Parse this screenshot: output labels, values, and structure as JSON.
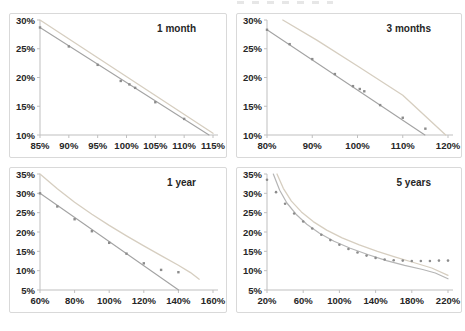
{
  "style": {
    "background": "#ffffff",
    "panel_border": "#d9d9d9",
    "axis_color": "#bfbfbf",
    "text_color": "#262626",
    "model_line_color": "#d6cec0",
    "market_line_color": "#a3a3a3",
    "marker_color": "#8c8c8c"
  },
  "chart_data": [
    {
      "type": "line",
      "title": "1 month",
      "xlim": [
        85,
        115
      ],
      "xticks": [
        85,
        90,
        95,
        100,
        105,
        110,
        115
      ],
      "ylim": [
        10,
        30
      ],
      "yticks": [
        10,
        15,
        20,
        25,
        30
      ],
      "tick_suffix": "%",
      "grid": false,
      "series": [
        {
          "name": "model-smile-line",
          "color": "#d6cec0",
          "width": 1.3,
          "line": true,
          "points": [
            [
              85,
              30
            ],
            [
              115,
              10.3
            ]
          ]
        },
        {
          "name": "market-iv-points",
          "color": "#a3a3a3",
          "width": 1.1,
          "line": true,
          "marker": "square",
          "marker_color": "#8c8c8c",
          "points": [
            [
              85,
              28.7
            ],
            [
              114.3,
              10
            ]
          ],
          "marker_points": [
            [
              85,
              28.7
            ],
            [
              90,
              25.4
            ],
            [
              95,
              22.2
            ],
            [
              99,
              19.4
            ],
            [
              100.5,
              18.8
            ],
            [
              101.5,
              18.2
            ],
            [
              105,
              15.7
            ],
            [
              110,
              12.8
            ]
          ]
        }
      ]
    },
    {
      "type": "line",
      "title": "3 months",
      "xlim": [
        80,
        120
      ],
      "xticks": [
        80,
        90,
        100,
        110,
        120
      ],
      "ylim": [
        10,
        30
      ],
      "yticks": [
        10,
        15,
        20,
        25,
        30
      ],
      "tick_suffix": "%",
      "grid": false,
      "series": [
        {
          "name": "model-smile-line",
          "color": "#d6cec0",
          "width": 1.3,
          "line": true,
          "points": [
            [
              83.5,
              30
            ],
            [
              91,
              26.5
            ],
            [
              100,
              22.0
            ],
            [
              110,
              16.9
            ],
            [
              119.5,
              10
            ]
          ]
        },
        {
          "name": "market-iv-points",
          "color": "#a3a3a3",
          "width": 1.1,
          "line": true,
          "marker": "square",
          "marker_color": "#8c8c8c",
          "points": [
            [
              80,
              28.3
            ],
            [
              114.9,
              10
            ]
          ],
          "marker_points": [
            [
              80,
              28.3
            ],
            [
              85,
              25.8
            ],
            [
              90,
              23.2
            ],
            [
              95,
              20.6
            ],
            [
              99,
              18.5
            ],
            [
              100.5,
              18.0
            ],
            [
              101.5,
              17.6
            ],
            [
              105,
              15.2
            ],
            [
              110,
              13.0
            ],
            [
              115,
              11.1
            ]
          ]
        }
      ]
    },
    {
      "type": "line",
      "title": "1 year",
      "xlim": [
        60,
        160
      ],
      "xticks": [
        60,
        80,
        100,
        120,
        140,
        160
      ],
      "ylim": [
        5,
        35
      ],
      "yticks": [
        5,
        10,
        15,
        20,
        25,
        30,
        35
      ],
      "tick_suffix": "%",
      "grid": false,
      "series": [
        {
          "name": "model-smile-line",
          "color": "#d6cec0",
          "width": 1.3,
          "line": true,
          "points": [
            [
              60,
              35
            ],
            [
              70,
              31.2
            ],
            [
              80,
              27.7
            ],
            [
              90,
              24.6
            ],
            [
              100,
              21.7
            ],
            [
              110,
              19.0
            ],
            [
              120,
              16.4
            ],
            [
              130,
              13.9
            ],
            [
              140,
              11.4
            ],
            [
              147,
              9.5
            ],
            [
              152,
              7.8
            ]
          ]
        },
        {
          "name": "market-iv-points",
          "color": "#a3a3a3",
          "width": 1.1,
          "line": true,
          "marker": "square",
          "marker_color": "#8c8c8c",
          "points": [
            [
              60,
              30
            ],
            [
              140.1,
              5
            ]
          ],
          "marker_points": [
            [
              60,
              30
            ],
            [
              70,
              26.6
            ],
            [
              80,
              23.3
            ],
            [
              90,
              20.2
            ],
            [
              100,
              17.2
            ],
            [
              110,
              14.4
            ],
            [
              120,
              11.9
            ],
            [
              130,
              10.2
            ],
            [
              140,
              9.6
            ]
          ]
        }
      ]
    },
    {
      "type": "line",
      "title": "5 years",
      "xlim": [
        20,
        220
      ],
      "xticks": [
        20,
        60,
        100,
        140,
        180,
        220
      ],
      "ylim": [
        5,
        35
      ],
      "yticks": [
        5,
        10,
        15,
        20,
        25,
        30,
        35
      ],
      "tick_suffix": "%",
      "grid": false,
      "series": [
        {
          "name": "model-curve-gray",
          "color": "#b5b5b5",
          "width": 1.2,
          "line": true,
          "points": [
            [
              27,
              35
            ],
            [
              34,
              30.8
            ],
            [
              42,
              27.5
            ],
            [
              52,
              24.6
            ],
            [
              64,
              22.0
            ],
            [
              78,
              19.7
            ],
            [
              94,
              17.6
            ],
            [
              112,
              15.8
            ],
            [
              132,
              14.1
            ],
            [
              152,
              12.6
            ],
            [
              172,
              11.4
            ],
            [
              192,
              10.3
            ],
            [
              206,
              9.4
            ],
            [
              220,
              7.9
            ]
          ]
        },
        {
          "name": "model-curve-tan",
          "color": "#d6cec0",
          "width": 1.3,
          "line": true,
          "points": [
            [
              31,
              35
            ],
            [
              38,
              31.3
            ],
            [
              47,
              28.0
            ],
            [
              58,
              25.2
            ],
            [
              71,
              22.7
            ],
            [
              86,
              20.5
            ],
            [
              103,
              18.5
            ],
            [
              122,
              16.7
            ],
            [
              142,
              15.0
            ],
            [
              162,
              13.5
            ],
            [
              182,
              12.1
            ],
            [
              202,
              10.7
            ],
            [
              220,
              8.8
            ]
          ]
        },
        {
          "name": "market-iv-points",
          "color": "#8c8c8c",
          "line": false,
          "marker": "dot",
          "marker_color": "#8c8c8c",
          "marker_points": [
            [
              20,
              33.5
            ],
            [
              30,
              30.3
            ],
            [
              40,
              27.3
            ],
            [
              50,
              24.8
            ],
            [
              60,
              22.7
            ],
            [
              70,
              20.9
            ],
            [
              80,
              19.3
            ],
            [
              90,
              17.9
            ],
            [
              100,
              16.7
            ],
            [
              110,
              15.6
            ],
            [
              120,
              14.7
            ],
            [
              130,
              13.9
            ],
            [
              140,
              13.3
            ],
            [
              150,
              12.9
            ],
            [
              160,
              12.7
            ],
            [
              170,
              12.6
            ],
            [
              180,
              12.5
            ],
            [
              190,
              12.5
            ],
            [
              200,
              12.5
            ],
            [
              210,
              12.6
            ],
            [
              220,
              12.6
            ]
          ]
        }
      ]
    }
  ]
}
